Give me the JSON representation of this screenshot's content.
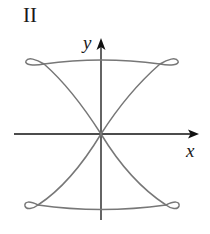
{
  "figure": {
    "panel_label": "II",
    "x_axis_label": "x",
    "y_axis_label": "y",
    "colors": {
      "axis": "#111111",
      "curve": "#777777",
      "text": "#1a1a1a",
      "background": "#ffffff"
    }
  }
}
